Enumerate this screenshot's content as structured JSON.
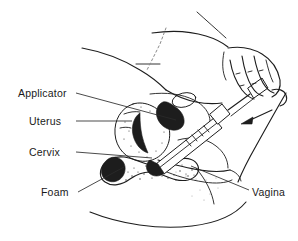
{
  "figure": {
    "ink_color": "#1d1d1d",
    "background_color": "#ffffff",
    "labels": [
      {
        "id": "applicator",
        "text": "Applicator",
        "x": 18,
        "y": 97,
        "anchor": "start",
        "side": "left"
      },
      {
        "id": "uterus",
        "text": "Uterus",
        "x": 29,
        "y": 125,
        "anchor": "start",
        "side": "left"
      },
      {
        "id": "cervix",
        "text": "Cervix",
        "x": 29,
        "y": 156,
        "anchor": "start",
        "side": "left"
      },
      {
        "id": "foam",
        "text": "Foam",
        "x": 41,
        "y": 196,
        "anchor": "start",
        "side": "left"
      },
      {
        "id": "vagina",
        "text": "Vagina",
        "x": 252,
        "y": 196,
        "anchor": "start",
        "side": "right"
      }
    ],
    "leader_lines": [
      {
        "id": "applicator-leader",
        "from": [
          76,
          93
        ],
        "to": [
          176,
          120
        ]
      },
      {
        "id": "uterus-leader",
        "from": [
          76,
          121
        ],
        "to": [
          132,
          121
        ]
      },
      {
        "id": "cervix-leader",
        "from": [
          76,
          152
        ],
        "to": [
          152,
          157
        ]
      },
      {
        "id": "foam-leader",
        "from": [
          78,
          192
        ],
        "to": [
          124,
          168
        ]
      },
      {
        "id": "vagina-leader",
        "from": [
          249,
          190
        ],
        "to": [
          191,
          166
        ]
      }
    ],
    "annotations": [
      {
        "id": "push-arrow",
        "kind": "arrow",
        "from": [
          272,
          110
        ],
        "to": [
          242,
          124
        ],
        "meaning": "direction plunger is pushed"
      }
    ]
  }
}
